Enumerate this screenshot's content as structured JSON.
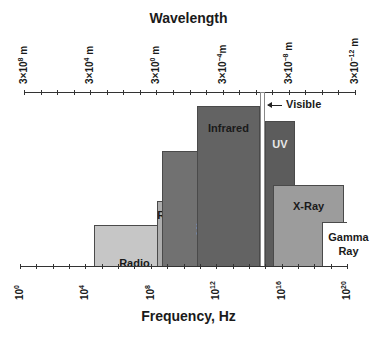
{
  "chart_data": {
    "type": "diagram",
    "title_top": "Wavelength",
    "title_bottom": "Frequency, Hz",
    "top_axis": {
      "label": "Wavelength",
      "ticks": [
        {
          "text": "3×10",
          "exp": "8",
          "unit": " m"
        },
        {
          "text": "3×10",
          "exp": "4",
          "unit": " m"
        },
        {
          "text": "3×10",
          "exp": "0",
          "unit": " m"
        },
        {
          "text": "3×10",
          "exp": "−4",
          "unit": "m"
        },
        {
          "text": "3×10",
          "exp": "−8",
          "unit": " m"
        },
        {
          "text": "3×10",
          "exp": "−12",
          "unit": " m"
        }
      ],
      "minor_tick_step_decades": 1
    },
    "bottom_axis": {
      "label": "Frequency, Hz",
      "range_log10": [
        0,
        20
      ],
      "ticks": [
        {
          "text": "10",
          "exp": "0",
          "log10": 0
        },
        {
          "text": "10",
          "exp": "4",
          "log10": 4
        },
        {
          "text": "10",
          "exp": "8",
          "log10": 8
        },
        {
          "text": "10",
          "exp": "12",
          "log10": 12
        },
        {
          "text": "10",
          "exp": "16",
          "log10": 16
        },
        {
          "text": "10",
          "exp": "20",
          "log10": 20
        }
      ],
      "minor_tick_step_decades": 1
    },
    "bands": [
      {
        "name": "Radio",
        "label": "Radio",
        "log10_from": 4.5,
        "log10_to": 9.5,
        "relative_height": 41,
        "color": "#c6c6c6",
        "text_color": "#1a1a1a"
      },
      {
        "name": "Radar",
        "label": "Radar",
        "log10_from": 8.4,
        "log10_to": 10.6,
        "relative_height": 65,
        "color": "#adadad",
        "text_color": "#1a1a1a"
      },
      {
        "name": "Microwave",
        "label": "Microwave",
        "log10_from": 8.7,
        "log10_to": 11.6,
        "relative_height": 115,
        "color": "#717171",
        "text_color": "#e8e8e8",
        "vertical_label": true
      },
      {
        "name": "Infrared",
        "label": "Infrared",
        "log10_from": 10.8,
        "log10_to": 14.7,
        "relative_height": 160,
        "color": "#636363",
        "text_color": "#1a1a1a"
      },
      {
        "name": "Visible",
        "label": "Visible",
        "log10_from": 14.7,
        "log10_to": 15.0,
        "relative_height": 174,
        "color": "#ffffff",
        "text_color": "#1a1a1a"
      },
      {
        "name": "UV",
        "label": "UV",
        "log10_from": 15.0,
        "log10_to": 16.8,
        "relative_height": 145,
        "color": "#5c5c5c",
        "text_color": "#e8e8e8"
      },
      {
        "name": "X-Ray",
        "label": "X-Ray",
        "log10_from": 15.5,
        "log10_to": 19.8,
        "relative_height": 81,
        "color": "#9c9c9c",
        "text_color": "#1a1a1a"
      },
      {
        "name": "Gamma Ray",
        "label_line1": "Gamma",
        "label_line2": "Ray",
        "log10_from": 18.5,
        "log10_to": 20.0,
        "relative_height": 44,
        "color": "#ffffff",
        "text_color": "#1a1a1a"
      }
    ]
  },
  "labels": {
    "wavelength": "Wavelength",
    "frequency": "Frequency, Hz",
    "visible": "Visible",
    "radio": "Radio",
    "radar": "Radar",
    "microwave": "Microwave",
    "infrared": "Infrared",
    "uv": "UV",
    "xray": "X-Ray",
    "gamma1": "Gamma",
    "gamma2": "Ray"
  }
}
